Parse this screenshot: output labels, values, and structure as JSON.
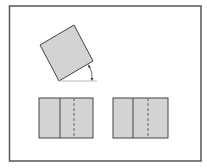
{
  "diagram": {
    "colors": {
      "frame": "#555555",
      "fill": "#d3d3d3",
      "stroke": "#444444",
      "baseline": "#bbbbbb",
      "background": "#ffffff"
    },
    "tilted_square": {
      "corners": [
        [
          40,
          45
        ],
        [
          74,
          25
        ],
        [
          93,
          61
        ],
        [
          59,
          81
        ]
      ]
    },
    "angle_marker": {
      "baseline_from": [
        59,
        81
      ],
      "baseline_to": [
        97,
        81
      ],
      "label": ""
    },
    "panels": [
      {
        "x": 39,
        "y": 98,
        "w": 54,
        "h": 40,
        "solid_x": 60,
        "dashed_x": 74
      },
      {
        "x": 113,
        "y": 98,
        "w": 55,
        "h": 40,
        "solid_x": 133,
        "dashed_x": 148
      }
    ]
  }
}
